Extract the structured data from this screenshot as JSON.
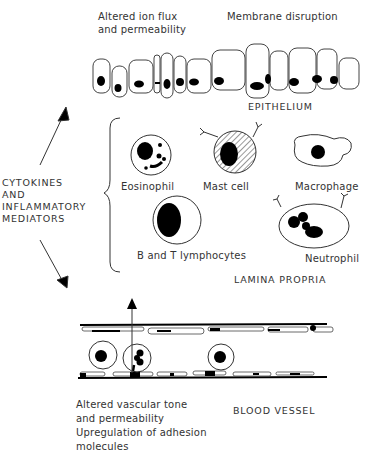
{
  "epithelium": {
    "title": "EPITHELIUM",
    "effect_left_line1": "Altered ion flux",
    "effect_left_line2": "and permeability",
    "effect_right": "Membrane disruption"
  },
  "mediators": {
    "line1": "CYTOKINES",
    "line2": "AND",
    "line3": "INFLAMMATORY",
    "line4": "MEDIATORS"
  },
  "lamina_propria": {
    "title": "LAMINA PROPRIA",
    "cells": [
      {
        "label": "Eosinophil"
      },
      {
        "label": "Mast cell"
      },
      {
        "label": "Macrophage"
      },
      {
        "label": "B and T lymphocytes"
      },
      {
        "label": "Neutrophil"
      }
    ]
  },
  "blood_vessel": {
    "title": "BLOOD VESSEL",
    "effect_line1": "Altered vascular tone",
    "effect_line2": "and permeability",
    "effect_line3": "Upregulation of adhesion",
    "effect_line4": "molecules"
  }
}
